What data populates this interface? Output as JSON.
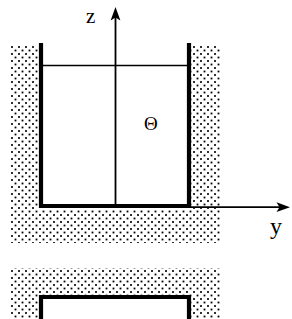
{
  "figure": {
    "type": "technical-line-diagram",
    "width": 292,
    "height": 319,
    "background_color": "#ffffff",
    "ink_color": "#000000"
  },
  "axes": {
    "vertical": {
      "label": "z",
      "direction": "up",
      "x": 115,
      "tip_y": 8,
      "base_y": 208
    },
    "horizontal": {
      "label": "y",
      "direction": "right",
      "y": 207,
      "tip_x": 289,
      "base_x": 115
    },
    "origin": {
      "x": 115,
      "y": 207
    }
  },
  "annotations": {
    "interior_symbol": "Θ",
    "interior_symbol_name": "Theta",
    "interior_symbol_x": 152,
    "interior_symbol_y": 124
  },
  "panels": [
    {
      "name": "upper-panel",
      "container": {
        "left": 39,
        "right": 191,
        "top": 45,
        "bottom": 208,
        "wall_thickness": 4,
        "open_top": true
      },
      "fluid_surface_y": 65,
      "hatch_region": {
        "left": 10,
        "right": 220,
        "top": 45,
        "bottom": 243
      }
    },
    {
      "name": "lower-panel",
      "container": {
        "left": 39,
        "right": 191,
        "top": 296,
        "bottom": 319,
        "wall_thickness": 4,
        "open_top": false
      },
      "hatch_region": {
        "left": 10,
        "right": 220,
        "top": 268,
        "bottom": 319
      }
    }
  ],
  "hatch_pattern": {
    "style": "dotted-stipple",
    "dot_size_px": 1.8,
    "spacing_px": 7,
    "staggered": true,
    "color": "#000000"
  }
}
